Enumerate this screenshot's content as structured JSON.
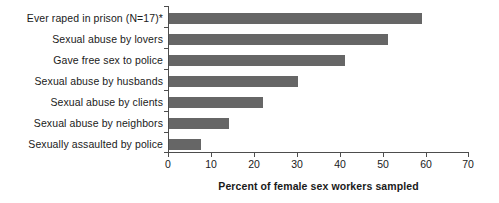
{
  "chart_data": {
    "type": "bar",
    "orientation": "horizontal",
    "title": "",
    "subtitle": "",
    "xlabel": "Percent of female sex workers sampled",
    "ylabel": "",
    "xlim": [
      0,
      70
    ],
    "xticks": [
      0,
      10,
      20,
      30,
      40,
      50,
      60,
      70
    ],
    "grid": false,
    "legend": null,
    "bar_color": "#666666",
    "axis_color": "#4d4d4d",
    "categories": [
      "Ever raped in prison (N=17)*",
      "Sexual abuse by lovers",
      "Gave free sex to police",
      "Sexual abuse by husbands",
      "Sexual abuse by clients",
      "Sexual abuse by neighbors",
      "Sexually assaulted by police"
    ],
    "values": [
      59,
      51,
      41,
      30,
      22,
      14,
      7.5
    ],
    "annotations": [
      "* N=17 for 'Ever raped in prison' category"
    ]
  },
  "axis": {
    "tick_labels": [
      "0",
      "10",
      "20",
      "30",
      "40",
      "50",
      "60",
      "70"
    ],
    "title": "Percent of female sex workers sampled"
  }
}
